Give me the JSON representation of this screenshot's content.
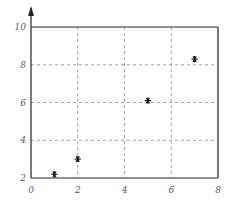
{
  "chart_data": {
    "type": "scatter",
    "title": "",
    "xlabel": "",
    "ylabel": "",
    "xlim": [
      0,
      8
    ],
    "ylim": [
      2,
      10
    ],
    "x_ticks": [
      0,
      2,
      4,
      6,
      8
    ],
    "y_ticks": [
      2,
      4,
      6,
      8,
      10
    ],
    "x_tick_labels": [
      "0",
      "2",
      "4",
      "6",
      "8"
    ],
    "y_tick_labels": [
      "2",
      "4",
      "6",
      "8",
      "10"
    ],
    "grid": true,
    "grid_style": "dashed",
    "marker": "*",
    "legend": null,
    "series": [
      {
        "name": "points",
        "x": [
          1,
          2,
          5,
          7
        ],
        "y": [
          2.2,
          3.0,
          6.1,
          8.3
        ]
      }
    ],
    "colors": {
      "axis": "#222222",
      "grid": "#888888",
      "marker": "#111111",
      "tick_label": "#555555"
    }
  }
}
